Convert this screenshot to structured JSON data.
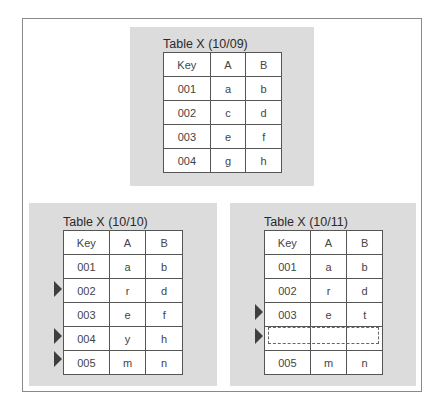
{
  "tables": [
    {
      "title": "Table X (10/09)",
      "headers": [
        "Key",
        "A",
        "B"
      ],
      "rows": [
        {
          "key": "001",
          "a": "a",
          "b": "b",
          "changed": false
        },
        {
          "key": "002",
          "a": "c",
          "b": "d",
          "changed": false
        },
        {
          "key": "003",
          "a": "e",
          "b": "f",
          "changed": false
        },
        {
          "key": "004",
          "a": "g",
          "b": "h",
          "changed": false
        }
      ]
    },
    {
      "title": "Table X (10/10)",
      "headers": [
        "Key",
        "A",
        "B"
      ],
      "rows": [
        {
          "key": "001",
          "a": "a",
          "b": "b",
          "changed": false
        },
        {
          "key": "002",
          "a": "r",
          "b": "d",
          "changed": true
        },
        {
          "key": "003",
          "a": "e",
          "b": "f",
          "changed": false
        },
        {
          "key": "004",
          "a": "y",
          "b": "h",
          "changed": true
        },
        {
          "key": "005",
          "a": "m",
          "b": "n",
          "changed": true
        }
      ]
    },
    {
      "title": "Table X (10/11)",
      "headers": [
        "Key",
        "A",
        "B"
      ],
      "rows": [
        {
          "key": "001",
          "a": "a",
          "b": "b",
          "changed": false
        },
        {
          "key": "002",
          "a": "r",
          "b": "d",
          "changed": false
        },
        {
          "key": "003",
          "a": "e",
          "b": "t",
          "changed": true
        },
        {
          "key": "",
          "a": "",
          "b": "",
          "changed": true,
          "deleted": true
        },
        {
          "key": "005",
          "a": "m",
          "b": "n",
          "changed": false
        }
      ]
    }
  ],
  "colors": {
    "panel_bg": "#dcdcdc",
    "frame_border": "#8a8a8a",
    "arrow": "#3e3e3e"
  }
}
